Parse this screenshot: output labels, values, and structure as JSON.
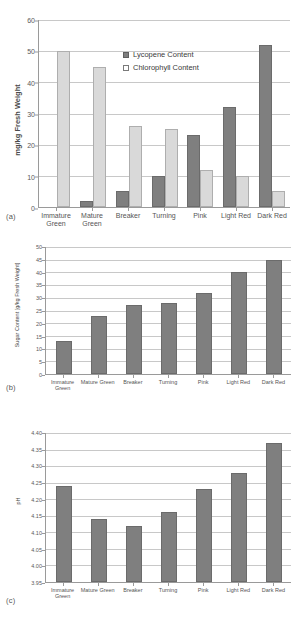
{
  "figure": {
    "panels": [
      {
        "tag": "(a)"
      },
      {
        "tag": "(b)"
      },
      {
        "tag": "(c)"
      }
    ]
  },
  "categories": [
    "Immature Green",
    "Mature Green",
    "Breaker",
    "Turning",
    "Pink",
    "Light Red",
    "Dark Red"
  ],
  "chart_data": [
    {
      "type": "bar",
      "panel": "(a)",
      "title": "",
      "xlabel": "",
      "ylabel": "mg/kg  Fresh Weight",
      "ylim": [
        0,
        60
      ],
      "yticks": [
        0,
        10,
        20,
        30,
        40,
        50,
        60
      ],
      "ytick_labels": [
        "0",
        "10",
        "20",
        "30",
        "40",
        "50",
        "60"
      ],
      "grid": true,
      "legend_position": "upper-center",
      "categories": [
        "Immature\nGreen",
        "Mature\nGreen",
        "Breaker",
        "Turning",
        "Pink",
        "Light Red",
        "Dark Red"
      ],
      "series": [
        {
          "name": "Lycopene Content",
          "color": "#7f7f7f",
          "values": [
            0,
            2,
            5,
            10,
            23,
            32,
            52
          ]
        },
        {
          "name": "Chlorophyll Content",
          "color": "#d9d9d9",
          "values": [
            50,
            45,
            26,
            25,
            12,
            10,
            5
          ]
        }
      ]
    },
    {
      "type": "bar",
      "panel": "(b)",
      "title": "",
      "xlabel": "",
      "ylabel": "Sugar Content [g/kg Fresh Weight]",
      "ylim": [
        0,
        50
      ],
      "yticks": [
        0,
        5,
        10,
        15,
        20,
        25,
        30,
        35,
        40,
        45,
        50
      ],
      "ytick_labels": [
        "0",
        "5",
        "10",
        "15",
        "20",
        "25",
        "30",
        "35",
        "40",
        "45",
        "50"
      ],
      "grid": true,
      "categories": [
        "Immature\nGreen",
        "Mature Green",
        "Breaker",
        "Turning",
        "Pink",
        "Light Red",
        "Dark Red"
      ],
      "series": [
        {
          "name": "Sugar Content",
          "color": "#7f7f7f",
          "values": [
            13,
            23,
            27,
            28,
            32,
            40,
            45
          ]
        }
      ]
    },
    {
      "type": "bar",
      "panel": "(c)",
      "title": "",
      "xlabel": "",
      "ylabel": "pH",
      "ylim": [
        3.95,
        4.4
      ],
      "yticks": [
        3.95,
        4.0,
        4.05,
        4.1,
        4.15,
        4.2,
        4.25,
        4.3,
        4.35,
        4.4
      ],
      "ytick_labels": [
        "3.95",
        "4.00",
        "4.05",
        "4.10",
        "4.15",
        "4.20",
        "4.25",
        "4.30",
        "4.35",
        "4.40"
      ],
      "grid": true,
      "categories": [
        "Immature\nGreen",
        "Mature Green",
        "Breaker",
        "Turning",
        "Pink",
        "Light Red",
        "Dark Red"
      ],
      "series": [
        {
          "name": "pH",
          "color": "#7f7f7f",
          "values": [
            4.24,
            4.14,
            4.12,
            4.16,
            4.23,
            4.28,
            4.37
          ]
        }
      ]
    }
  ]
}
